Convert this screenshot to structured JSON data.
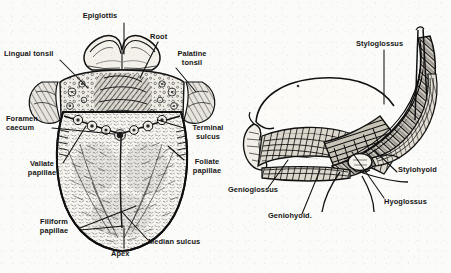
{
  "figure": {
    "style": "black-and-white engraved anatomical line drawing",
    "background_color": "#fbfbf9",
    "ink_color": "#141414"
  },
  "panels": [
    {
      "id": "dorsum-of-tongue",
      "caption": "Dorsal surface of the tongue",
      "labels": [
        {
          "id": "epiglottis",
          "text": "Epiglottis",
          "x": 99,
          "y": 12,
          "align": "center",
          "leader": [
            [
              124,
              23
            ],
            [
              124,
              54
            ]
          ]
        },
        {
          "id": "root",
          "text": "Root",
          "x": 150,
          "y": 33,
          "align": "left",
          "leader": [
            [
              158,
              42
            ],
            [
              140,
              76
            ]
          ]
        },
        {
          "id": "lingual-tonsil",
          "text": "Lingual tonsil",
          "x": 4,
          "y": 50,
          "align": "left",
          "leader": [
            [
              60,
              60
            ],
            [
              86,
              86
            ]
          ]
        },
        {
          "id": "palatine-tonsil",
          "text": "Palatine\ntonsil",
          "x": 172,
          "y": 50,
          "align": "left",
          "leader": [
            [
              175,
              68
            ],
            [
              163,
              80
            ]
          ]
        },
        {
          "id": "foramen-caecum",
          "text": "Foramen\ncaecum",
          "x": 6,
          "y": 115,
          "align": "left",
          "leader": [
            [
              52,
              128
            ],
            [
              110,
              114
            ]
          ]
        },
        {
          "id": "terminal-sulcus",
          "text": "Terminal\nsulcus",
          "x": 185,
          "y": 124,
          "align": "left",
          "leader": [
            [
              184,
              128
            ],
            [
              160,
              118
            ]
          ]
        },
        {
          "id": "vallate-papillae",
          "text": "Vallate\npapillae",
          "x": 24,
          "y": 160,
          "align": "left",
          "leader": [
            [
              63,
              163
            ],
            [
              88,
              140
            ]
          ]
        },
        {
          "id": "foliate-papillae",
          "text": "Foliate\npapillae",
          "x": 185,
          "y": 158,
          "align": "left",
          "leader": [
            [
              184,
              160
            ],
            [
              166,
              148
            ]
          ]
        },
        {
          "id": "filiform-papillae",
          "text": "Filiform\npapillae",
          "x": 30,
          "y": 218,
          "align": "left",
          "leader": [
            [
              80,
              228
            ],
            [
              132,
              210
            ]
          ]
        },
        {
          "id": "median-sulcus",
          "text": "Median sulcus",
          "x": 148,
          "y": 240,
          "align": "left",
          "leader": [
            [
              146,
              242
            ],
            [
              120,
              212
            ]
          ]
        },
        {
          "id": "apex",
          "text": "Apex",
          "x": 115,
          "y": 252,
          "align": "left",
          "leader": [
            [
              124,
              250
            ],
            [
              124,
              226
            ]
          ]
        }
      ]
    },
    {
      "id": "tongue-musculature",
      "caption": "Lateral view of extrinsic tongue muscles",
      "labels": [
        {
          "id": "styloglossus",
          "text": "Styloglossus",
          "x": 356,
          "y": 40,
          "align": "left",
          "leader": [
            [
              384,
              50
            ],
            [
              384,
              100
            ]
          ]
        },
        {
          "id": "stylohyoid",
          "text": "Stylohyold",
          "x": 398,
          "y": 168,
          "align": "left",
          "leader": [
            [
              397,
              172
            ],
            [
              372,
              154
            ]
          ]
        },
        {
          "id": "hyoglossus",
          "text": "Hyoglossus",
          "x": 384,
          "y": 200,
          "align": "left",
          "leader": [
            [
              383,
              200
            ],
            [
              348,
              164
            ]
          ]
        },
        {
          "id": "genioglossus",
          "text": "Genioglossus",
          "x": 229,
          "y": 188,
          "align": "left",
          "leader": [
            [
              265,
              188
            ],
            [
              285,
              168
            ]
          ]
        },
        {
          "id": "geniohyoid",
          "text": "Geniohyoid.",
          "x": 268,
          "y": 215,
          "align": "left",
          "leader": [
            [
              300,
              214
            ],
            [
              318,
              170
            ]
          ]
        }
      ]
    }
  ]
}
